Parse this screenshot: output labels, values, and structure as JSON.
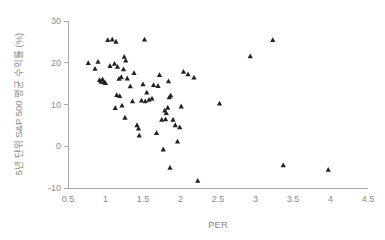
{
  "chart_data": {
    "type": "scatter",
    "title": "",
    "xlabel": "PER",
    "ylabel": "5년 단위 S&P 500 평균 수익률 (%)",
    "xlim": [
      0.5,
      4.5
    ],
    "ylim": [
      -10,
      30
    ],
    "xticks": [
      "0.5",
      "1",
      "1.5",
      "2",
      "2.5",
      "3",
      "3.5",
      "4",
      "4.5"
    ],
    "xtick_values": [
      0.5,
      1,
      1.5,
      2,
      2.5,
      3,
      3.5,
      4,
      4.5
    ],
    "yticks": [
      "30",
      "20",
      "10",
      "0",
      "-10"
    ],
    "ytick_values": [
      30,
      20,
      10,
      0,
      -10
    ],
    "grid": false,
    "legend": false,
    "marker": "triangle",
    "marker_color": "#222222",
    "axis_color": "#a6a6a6",
    "label_color": "#8a8a8a",
    "points": [
      [
        0.77,
        20.0
      ],
      [
        0.86,
        18.6
      ],
      [
        0.9,
        20.3
      ],
      [
        0.92,
        15.9
      ],
      [
        0.94,
        15.5
      ],
      [
        0.96,
        16.1
      ],
      [
        0.98,
        15.4
      ],
      [
        1.0,
        15.2
      ],
      [
        1.03,
        25.5
      ],
      [
        1.09,
        25.6
      ],
      [
        1.14,
        25.1
      ],
      [
        1.06,
        19.3
      ],
      [
        1.12,
        19.8
      ],
      [
        1.16,
        19.1
      ],
      [
        1.18,
        16.2
      ],
      [
        1.21,
        16.6
      ],
      [
        1.25,
        21.5
      ],
      [
        1.27,
        20.6
      ],
      [
        1.24,
        18.5
      ],
      [
        1.29,
        16.3
      ],
      [
        1.15,
        12.3
      ],
      [
        1.19,
        12.1
      ],
      [
        1.13,
        9.2
      ],
      [
        1.22,
        9.8
      ],
      [
        1.26,
        6.9
      ],
      [
        1.33,
        14.4
      ],
      [
        1.38,
        17.6
      ],
      [
        1.36,
        10.8
      ],
      [
        1.42,
        5.1
      ],
      [
        1.44,
        4.3
      ],
      [
        1.45,
        2.6
      ],
      [
        1.52,
        25.6
      ],
      [
        1.5,
        14.9
      ],
      [
        1.55,
        12.9
      ],
      [
        1.48,
        11.0
      ],
      [
        1.53,
        10.8
      ],
      [
        1.58,
        11.2
      ],
      [
        1.62,
        11.5
      ],
      [
        1.64,
        14.7
      ],
      [
        1.7,
        14.5
      ],
      [
        1.72,
        17.1
      ],
      [
        1.68,
        3.2
      ],
      [
        1.75,
        6.4
      ],
      [
        1.77,
        -0.7
      ],
      [
        1.79,
        8.6
      ],
      [
        1.81,
        8.0
      ],
      [
        1.83,
        9.3
      ],
      [
        1.8,
        6.5
      ],
      [
        1.85,
        11.8
      ],
      [
        1.87,
        12.2
      ],
      [
        1.84,
        15.6
      ],
      [
        1.9,
        6.4
      ],
      [
        1.93,
        5.1
      ],
      [
        1.86,
        -5.1
      ],
      [
        1.96,
        1.2
      ],
      [
        1.99,
        4.6
      ],
      [
        2.01,
        9.6
      ],
      [
        2.04,
        17.9
      ],
      [
        2.1,
        17.3
      ],
      [
        2.18,
        16.5
      ],
      [
        2.23,
        -8.2
      ],
      [
        2.52,
        10.3
      ],
      [
        2.93,
        21.6
      ],
      [
        3.23,
        25.5
      ],
      [
        3.37,
        -4.5
      ],
      [
        3.97,
        -5.6
      ]
    ]
  }
}
